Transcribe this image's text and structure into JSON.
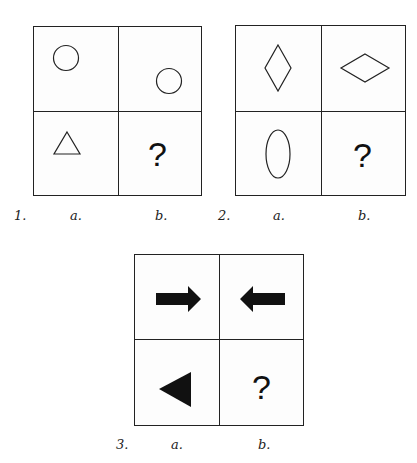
{
  "puzzles": [
    {
      "number": "1.",
      "col_a": "a.",
      "col_b": "b.",
      "cells": {
        "top_left": "circle-outline",
        "top_right": "circle-outline (lower-right position)",
        "bottom_left": "triangle-outline",
        "bottom_right": "?"
      }
    },
    {
      "number": "2.",
      "col_a": "a.",
      "col_b": "b.",
      "cells": {
        "top_left": "vertical-diamond-outline",
        "top_right": "horizontal-diamond-outline",
        "bottom_left": "vertical-ellipse-outline",
        "bottom_right": "?"
      }
    },
    {
      "number": "3.",
      "col_a": "a.",
      "col_b": "b.",
      "cells": {
        "top_left": "black-arrow-right",
        "top_right": "black-arrow-left",
        "bottom_left": "black-triangle-left",
        "bottom_right": "?"
      }
    }
  ],
  "question_mark": "?"
}
